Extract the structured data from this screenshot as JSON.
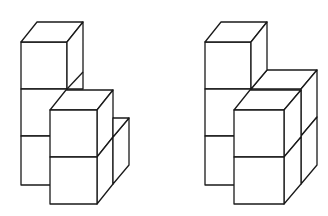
{
  "figure": {
    "stroke_color": "#1a1a1a",
    "background": "#ffffff",
    "shapes": [
      {
        "id": "left",
        "label": "left-cube-structure",
        "cube_count": 6
      },
      {
        "id": "right",
        "label": "right-cube-structure",
        "cube_count": 7
      }
    ]
  }
}
